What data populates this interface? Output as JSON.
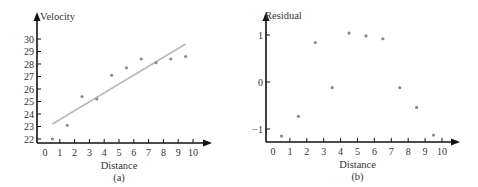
{
  "chart_data": [
    {
      "type": "scatter",
      "panel_label": "(a)",
      "title": "",
      "xlabel": "Distance",
      "ylabel": "Velocity",
      "x_ticks": [
        0,
        1,
        2,
        3,
        4,
        5,
        6,
        7,
        8,
        9,
        10
      ],
      "y_ticks": [
        22,
        23,
        24,
        25,
        26,
        27,
        28,
        29,
        30
      ],
      "xlim": [
        0,
        10.5
      ],
      "ylim": [
        22,
        30.5
      ],
      "grid": false,
      "series": [
        {
          "name": "observations",
          "kind": "scatter",
          "x": [
            0.5,
            1.5,
            2.5,
            3.5,
            4.5,
            5.5,
            6.5,
            7.5,
            8.5,
            9.5
          ],
          "y": [
            22.0,
            23.1,
            25.4,
            25.2,
            27.1,
            27.7,
            28.4,
            28.1,
            28.4,
            28.6
          ]
        },
        {
          "name": "regression line",
          "kind": "line",
          "x": [
            0.5,
            9.5
          ],
          "y": [
            23.2,
            29.6
          ]
        }
      ]
    },
    {
      "type": "scatter",
      "panel_label": "(b)",
      "title": "",
      "xlabel": "Distance",
      "ylabel": "Residual",
      "x_ticks": [
        0,
        1,
        2,
        3,
        4,
        5,
        6,
        7,
        8,
        9,
        10
      ],
      "y_ticks": [
        -1,
        0,
        1
      ],
      "xlim": [
        0,
        10.5
      ],
      "ylim": [
        -1.25,
        1.25
      ],
      "grid": false,
      "series": [
        {
          "name": "residuals",
          "kind": "scatter",
          "x": [
            0.5,
            1.5,
            2.5,
            3.5,
            4.5,
            5.5,
            6.5,
            7.5,
            8.5,
            9.5
          ],
          "y": [
            -1.15,
            -0.73,
            0.84,
            -0.12,
            1.04,
            0.98,
            0.92,
            -0.12,
            -0.54,
            -1.13
          ]
        }
      ]
    }
  ],
  "colors": {
    "axis": "#111111",
    "point": "#8a8a8a",
    "line": "#bdbdbd",
    "text": "#333333"
  }
}
